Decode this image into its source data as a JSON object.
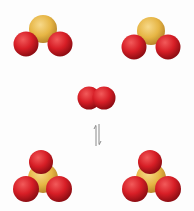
{
  "diagram": {
    "reactants": [
      {
        "id": "so2-left",
        "formula": "SO2",
        "atoms": [
          "S",
          "O",
          "O"
        ]
      },
      {
        "id": "so2-right",
        "formula": "SO2",
        "atoms": [
          "S",
          "O",
          "O"
        ]
      },
      {
        "id": "o2",
        "formula": "O2",
        "atoms": [
          "O",
          "O"
        ]
      }
    ],
    "products": [
      {
        "id": "so3-left",
        "formula": "SO3",
        "atoms": [
          "S",
          "O",
          "O",
          "O"
        ]
      },
      {
        "id": "so3-right",
        "formula": "SO3",
        "atoms": [
          "S",
          "O",
          "O",
          "O"
        ]
      }
    ],
    "arrow": "equilibrium-arrow",
    "colors": {
      "sulfur": "#e8b84a",
      "oxygen": "#d8202a",
      "background": "#fdfdfd",
      "arrow": "#888888"
    }
  }
}
